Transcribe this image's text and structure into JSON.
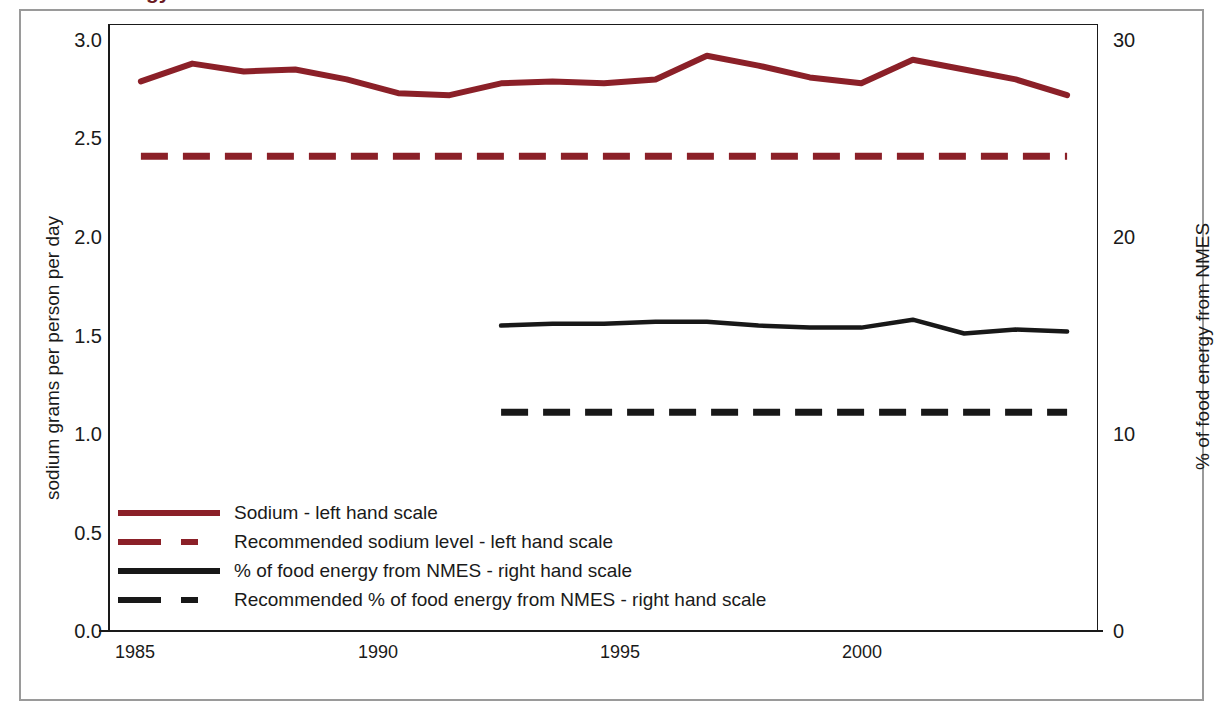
{
  "page": {
    "cut_off_top_text_left": "gy",
    "cut_off_top_text_right": "f"
  },
  "axes": {
    "left_title": "sodium grams per person per day",
    "right_title": "% of food energy from NMES",
    "left_ticks": [
      "3.0",
      "2.5",
      "2.0",
      "1.5",
      "1.0",
      "0.5",
      "0.0"
    ],
    "right_ticks": [
      "30",
      "20",
      "10",
      "0"
    ],
    "x_ticks": [
      "1985",
      "1990",
      "1995",
      "2000"
    ]
  },
  "legend": {
    "items": [
      {
        "label": "Sodium - left hand scale",
        "style": "solid-red",
        "color": "#8B2028"
      },
      {
        "label": "Recommended sodium level - left hand scale",
        "style": "dash-red",
        "color": "#8B2028"
      },
      {
        "label": "% of food energy from NMES - right hand scale",
        "style": "solid-black",
        "color": "#181818"
      },
      {
        "label": "Recommended % of food energy from NMES - right hand scale",
        "style": "dash-black",
        "color": "#181818"
      }
    ]
  },
  "chart_data": {
    "type": "line",
    "title": "",
    "xlabel": "",
    "grid": false,
    "legend_position": "inside-bottom-left",
    "x": [
      1985,
      1986,
      1987,
      1988,
      1989,
      1990,
      1991,
      1992,
      1993,
      1994,
      1995,
      1996,
      1997,
      1998,
      1999,
      2000,
      2001,
      2002,
      2003
    ],
    "x_ticks": [
      1985,
      1990,
      1995,
      2000
    ],
    "xlim": [
      1984.4,
      2003.6
    ],
    "left_axis": {
      "label": "sodium grams per person per day",
      "ylim": [
        0.0,
        3.0
      ],
      "ticks": [
        0.0,
        0.5,
        1.0,
        1.5,
        2.0,
        2.5,
        3.0
      ]
    },
    "right_axis": {
      "label": "% of food energy from NMES",
      "ylim": [
        0,
        30
      ],
      "ticks": [
        0,
        10,
        20,
        30
      ]
    },
    "series": [
      {
        "name": "Sodium - left hand scale",
        "axis": "left",
        "style": "solid",
        "color": "#8B2028",
        "x": [
          1985,
          1986,
          1987,
          1988,
          1989,
          1990,
          1991,
          1992,
          1993,
          1994,
          1995,
          1996,
          1997,
          1998,
          1999,
          2000,
          2001,
          2002,
          2003
        ],
        "values": [
          2.79,
          2.88,
          2.84,
          2.85,
          2.8,
          2.73,
          2.72,
          2.78,
          2.79,
          2.78,
          2.8,
          2.92,
          2.87,
          2.81,
          2.78,
          2.9,
          2.85,
          2.8,
          2.72
        ]
      },
      {
        "name": "Recommended sodium level - left hand scale",
        "axis": "left",
        "style": "dashed",
        "color": "#8B2028",
        "x": [
          1985,
          2003
        ],
        "values": [
          2.41,
          2.41
        ]
      },
      {
        "name": "% of food energy from NMES - right hand scale",
        "axis": "right",
        "style": "solid",
        "color": "#181818",
        "x": [
          1992,
          1993,
          1994,
          1995,
          1996,
          1997,
          1998,
          1999,
          2000,
          2001,
          2002,
          2003
        ],
        "values": [
          15.5,
          15.6,
          15.6,
          15.7,
          15.7,
          15.5,
          15.4,
          15.4,
          15.8,
          15.1,
          15.3,
          15.2
        ]
      },
      {
        "name": "Recommended % of food energy from NMES - right hand scale",
        "axis": "right",
        "style": "dashed",
        "color": "#181818",
        "x": [
          1992,
          2003
        ],
        "values": [
          11.1,
          11.1
        ]
      }
    ]
  }
}
